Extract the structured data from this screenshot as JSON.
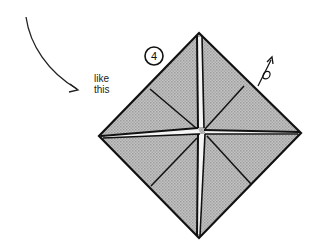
{
  "diagram": {
    "type": "origami-instruction",
    "step": {
      "number": "4",
      "badge_center": [
        154,
        56
      ],
      "badge_radius": 9
    },
    "annotation": {
      "line1": "like",
      "line2": "this"
    },
    "colors": {
      "background": "#ffffff",
      "ink": "#111111",
      "paper_fill": "#b9b9b9",
      "paper_pattern": "#9a9a9a",
      "gap": "#f4f4f4"
    },
    "model": {
      "shape": "diamond",
      "corners": {
        "top": [
          199,
          33
        ],
        "right": [
          301,
          133
        ],
        "bottom": [
          199,
          238
        ],
        "left": [
          99,
          136
        ]
      },
      "center": [
        201,
        130
      ]
    },
    "curved_arrow": {
      "start": [
        26,
        17
      ],
      "end": [
        78,
        90
      ],
      "meaning": "direction-indicator"
    },
    "fold_symbol": {
      "position": [
        265,
        70
      ],
      "meaning": "open-and-squash-arrow"
    }
  }
}
